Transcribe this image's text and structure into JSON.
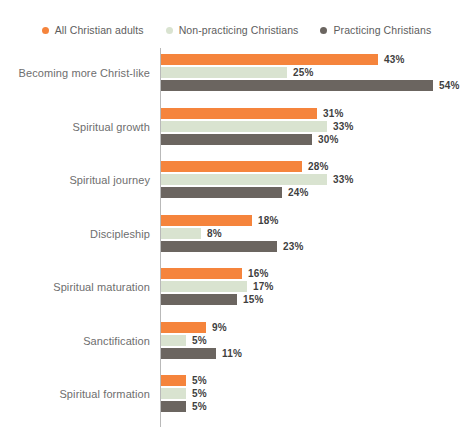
{
  "legend": {
    "items": [
      {
        "label": "All Christian adults",
        "color": "#F5843C",
        "icon": "legend-dot-icon"
      },
      {
        "label": "Non-practicing Christians",
        "color": "#D9E3D0",
        "icon": "legend-dot-icon"
      },
      {
        "label": "Practicing Christians",
        "color": "#6B6560",
        "icon": "legend-dot-icon"
      }
    ]
  },
  "chart_data": {
    "type": "bar",
    "orientation": "horizontal",
    "title": "",
    "subtitle": "",
    "xlabel": "",
    "ylabel": "",
    "xlim": [
      0,
      60
    ],
    "grid": false,
    "legend_position": "top-center",
    "value_suffix": "%",
    "categories": [
      "Becoming more Christ-like",
      "Spiritual growth",
      "Spiritual journey",
      "Discipleship",
      "Spiritual maturation",
      "Sanctification",
      "Spiritual formation"
    ],
    "series": [
      {
        "name": "All Christian adults",
        "color": "#F5843C",
        "values": [
          43,
          31,
          28,
          18,
          16,
          9,
          5
        ],
        "labels": [
          "43%",
          "31%",
          "28%",
          "18%",
          "16%",
          "9%",
          "5%"
        ]
      },
      {
        "name": "Non-practicing Christians",
        "color": "#D9E3D0",
        "values": [
          25,
          33,
          33,
          8,
          17,
          5,
          5
        ],
        "labels": [
          "25%",
          "33%",
          "33%",
          "8%",
          "17%",
          "5%",
          "5%"
        ]
      },
      {
        "name": "Practicing Christians",
        "color": "#6B6560",
        "values": [
          54,
          30,
          24,
          23,
          15,
          11,
          5
        ],
        "labels": [
          "54%",
          "30%",
          "24%",
          "23%",
          "15%",
          "11%",
          "5%"
        ]
      }
    ]
  },
  "layout": {
    "axis_x": 160,
    "px_per_unit": 5.04,
    "group_height": 53.5,
    "group_top": 6
  }
}
